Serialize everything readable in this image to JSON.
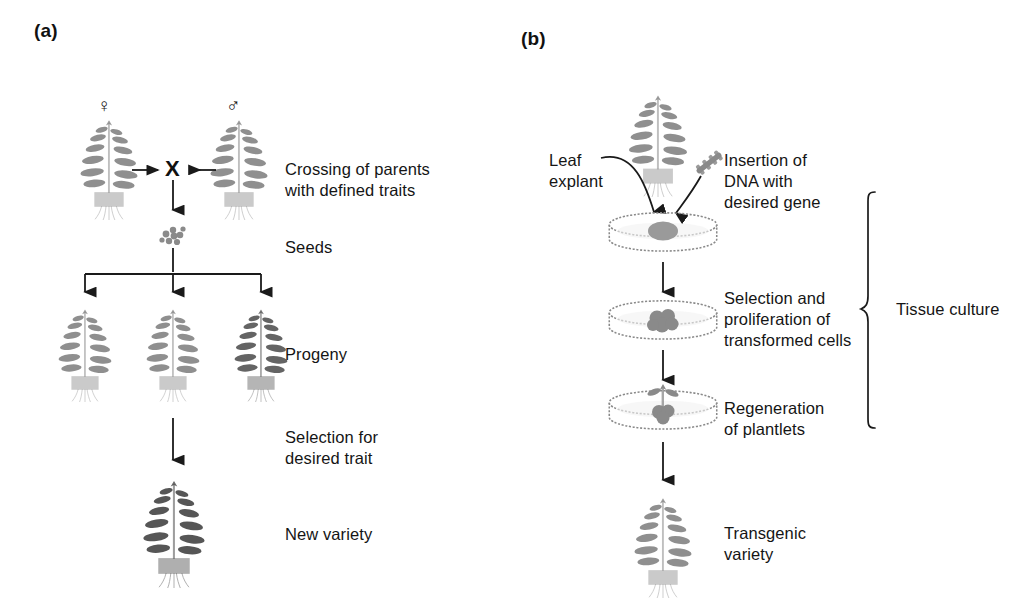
{
  "figure": {
    "type": "scientific-diagram",
    "background_color": "#ffffff",
    "ink_color": "#1a1a1a",
    "plant_color": "#808080",
    "plant_color_dark": "#4d4d4d"
  },
  "panel_a": {
    "label": "(a)",
    "symbols": {
      "female": "♀",
      "male": "♂",
      "cross": "X"
    },
    "steps": [
      {
        "id": "crossing",
        "caption": "Crossing of parents\nwith defined traits"
      },
      {
        "id": "seeds",
        "caption": "Seeds"
      },
      {
        "id": "progeny",
        "caption": "Progeny"
      },
      {
        "id": "selection",
        "caption": "Selection for\ndesired trait"
      },
      {
        "id": "new-variety",
        "caption": "New variety"
      }
    ],
    "progeny_count": 3
  },
  "panel_b": {
    "label": "(b)",
    "annotations": [
      {
        "id": "leaf-explant",
        "caption": "Leaf\nexplant"
      },
      {
        "id": "dna-insertion",
        "caption": "Insertion of\nDNA with\ndesired gene"
      }
    ],
    "steps": [
      {
        "id": "selection-proliferation",
        "caption": "Selection and\nproliferation of\ntransformed cells"
      },
      {
        "id": "regeneration",
        "caption": "Regeneration\nof plantlets"
      },
      {
        "id": "transgenic-variety",
        "caption": "Transgenic\nvariety"
      }
    ],
    "bracket": {
      "caption": "Tissue culture"
    },
    "dish_count": 3
  }
}
